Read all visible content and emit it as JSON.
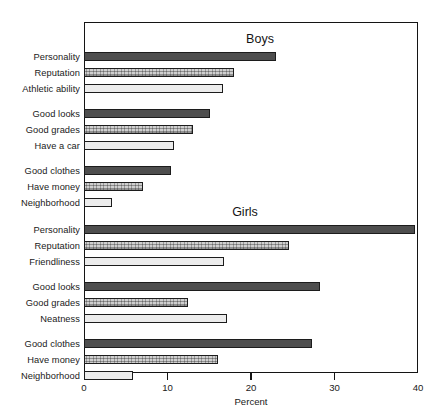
{
  "chart_data": {
    "type": "bar",
    "orientation": "horizontal",
    "title": "",
    "xlabel": "Percent",
    "ylabel": "",
    "xlim": [
      0,
      40
    ],
    "xticks": [
      0,
      10,
      20,
      30,
      40
    ],
    "xtick_labels": [
      "0",
      "10",
      "20",
      "30",
      "40"
    ],
    "grid": false,
    "legend": false,
    "panels": [
      {
        "name": "Boys",
        "title": "Boys",
        "groups": [
          {
            "categories": [
              "Personality",
              "Reputation",
              "Athletic ability"
            ],
            "values": [
              23,
              18,
              16.7
            ]
          },
          {
            "categories": [
              "Good looks",
              "Good grades",
              "Have a car"
            ],
            "values": [
              15.1,
              13,
              10.8
            ]
          },
          {
            "categories": [
              "Good clothes",
              "Have money",
              "Neighborhood"
            ],
            "values": [
              10.4,
              7.1,
              3.3
            ]
          }
        ]
      },
      {
        "name": "Girls",
        "title": "Girls",
        "groups": [
          {
            "categories": [
              "Personality",
              "Reputation",
              "Friendliness"
            ],
            "values": [
              39.6,
              24.5,
              16.8
            ]
          },
          {
            "categories": [
              "Good looks",
              "Good grades",
              "Neatness"
            ],
            "values": [
              28.3,
              12.4,
              17.1
            ]
          },
          {
            "categories": [
              "Good clothes",
              "Have money",
              "Neighborhood"
            ],
            "values": [
              27.3,
              16,
              5.9
            ]
          }
        ]
      }
    ],
    "colors": {
      "shade_dark": "#4e4e4e",
      "shade_mid": "#cfcfcf",
      "shade_light": "#ececec",
      "outline": "#1c1c1c",
      "frame": "#141414",
      "background": "#ffffff"
    }
  }
}
